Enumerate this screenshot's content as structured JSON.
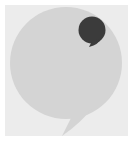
{
  "icon": {
    "name": "chat-bubbles-icon",
    "colors": {
      "page_background": "#ffffff",
      "tile_background": "#ececec",
      "large_bubble": "#d4d4d4",
      "small_bubble": "#3b3b3b"
    }
  }
}
